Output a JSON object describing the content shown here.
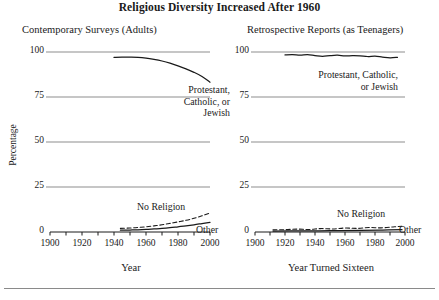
{
  "chart_data": {
    "type": "line",
    "title": "Religious Diversity Increased After 1960",
    "ylabel": "Percentage",
    "yticks": [
      0,
      25,
      50,
      75,
      100
    ],
    "ylim": [
      0,
      100
    ],
    "xticks": [
      1900,
      1920,
      1940,
      1960,
      1980,
      2000
    ],
    "xlim": [
      1900,
      2000
    ],
    "xtick_minor_step": 10,
    "grid": "horizontal",
    "legend": "inline-annotations",
    "panels": [
      {
        "id": "contemporary",
        "title": "Contemporary Surveys (Adults)",
        "xlabel": "Year",
        "series": [
          {
            "name": "Protestant, Catholic, or Jewish",
            "label_lines": [
              "Protestant,",
              "Catholic, or",
              "Jewish"
            ],
            "style": "solid",
            "x": [
              1940,
              1945,
              1950,
              1955,
              1960,
              1965,
              1970,
              1975,
              1980,
              1985,
              1990,
              1995,
              2000
            ],
            "y": [
              97.0,
              97.1,
              97.1,
              97.0,
              96.6,
              95.9,
              95.0,
              93.8,
              92.3,
              90.6,
              88.7,
              86.4,
              83.2
            ]
          },
          {
            "name": "No Religion",
            "label_lines": [
              "No Religion"
            ],
            "style": "dashed",
            "x": [
              1944,
              1950,
              1955,
              1960,
              1965,
              1970,
              1975,
              1980,
              1985,
              1990,
              1995,
              2000
            ],
            "y": [
              2.0,
              2.2,
              2.5,
              2.9,
              3.4,
              4.0,
              4.8,
              5.6,
              6.5,
              7.6,
              9.0,
              10.6
            ]
          },
          {
            "name": "Other",
            "label_lines": [
              "Other"
            ],
            "style": "solid",
            "x": [
              1944,
              1950,
              1955,
              1960,
              1965,
              1970,
              1975,
              1980,
              1985,
              1990,
              1995,
              2000
            ],
            "y": [
              1.0,
              1.1,
              1.2,
              1.4,
              1.7,
              2.0,
              2.4,
              2.9,
              3.4,
              4.0,
              4.7,
              5.4
            ]
          }
        ]
      },
      {
        "id": "retrospective",
        "title": "Retrospective Reports (as Teenagers)",
        "xlabel": "Year Turned Sixteen",
        "series": [
          {
            "name": "Protestant, Catholic, or Jewish",
            "label_lines": [
              "Protestant, Catholic,",
              "or Jewish"
            ],
            "style": "solid",
            "x": [
              1920,
              1925,
              1930,
              1935,
              1940,
              1945,
              1950,
              1955,
              1960,
              1965,
              1970,
              1975,
              1980,
              1985,
              1990,
              1995
            ],
            "y": [
              98.4,
              98.6,
              98.2,
              98.5,
              98.0,
              97.6,
              98.0,
              98.2,
              97.8,
              98.0,
              97.9,
              97.5,
              97.7,
              97.2,
              96.8,
              97.0
            ]
          },
          {
            "name": "No Religion",
            "label_lines": [
              "No Religion"
            ],
            "style": "dashed",
            "x": [
              1912,
              1920,
              1928,
              1936,
              1944,
              1952,
              1960,
              1968,
              1976,
              1984,
              1992,
              1998
            ],
            "y": [
              1.2,
              1.3,
              1.6,
              1.4,
              1.9,
              1.7,
              2.2,
              2.0,
              2.5,
              2.3,
              2.8,
              3.2
            ]
          },
          {
            "name": "Other",
            "label_lines": [
              "Other"
            ],
            "style": "solid",
            "x": [
              1912,
              1930,
              1950,
              1970,
              1985,
              1998
            ],
            "y": [
              0.5,
              0.6,
              0.7,
              0.9,
              1.1,
              1.3
            ]
          }
        ]
      }
    ]
  },
  "axes_geometry": {
    "left_panel": {
      "x0": 50,
      "x1": 210,
      "y0": 232,
      "y100": 52
    },
    "right_panel": {
      "x0": 255,
      "x1": 405,
      "y0": 232,
      "y100": 52
    }
  }
}
